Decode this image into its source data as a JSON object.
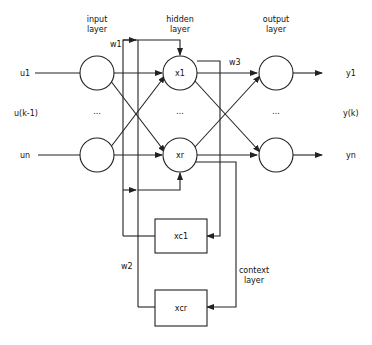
{
  "diagram": {
    "type": "Elman recurrent neural network",
    "colors": {
      "line": "#222222",
      "background": "#ffffff",
      "text": "#111111"
    },
    "layers": {
      "input": {
        "title_line1": "input",
        "title_line2": "layer"
      },
      "hidden": {
        "title_line1": "hidden",
        "title_line2": "layer"
      },
      "output": {
        "title_line1": "output",
        "title_line2": "layer"
      },
      "context": {
        "title_line1": "context",
        "title_line2": "layer"
      }
    },
    "inputs": [
      "u1",
      "u(k-1)",
      "un"
    ],
    "outputs": [
      "y1",
      "y(k)",
      "yn"
    ],
    "hidden_nodes": [
      "x1",
      "xr"
    ],
    "context_nodes": [
      "xc1",
      "xcr"
    ],
    "weights": [
      "w1",
      "w2",
      "w3"
    ],
    "ellipsis": "..."
  }
}
